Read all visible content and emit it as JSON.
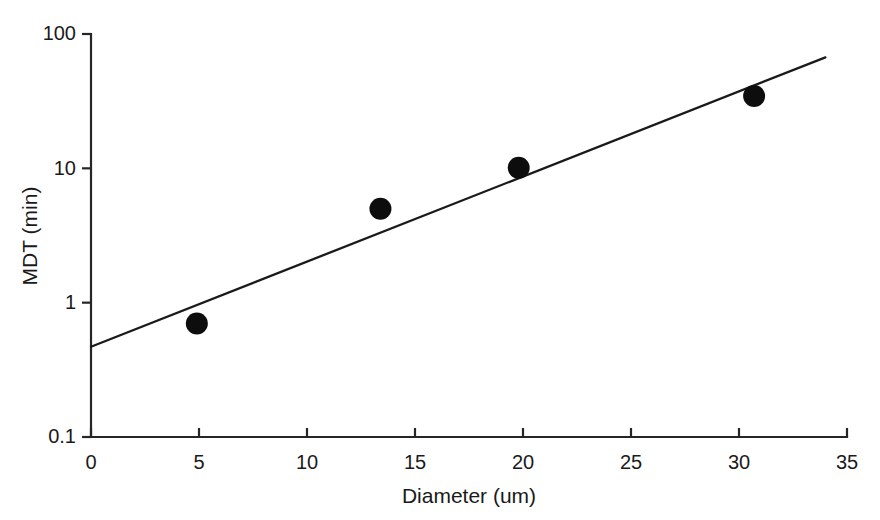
{
  "figure": {
    "background_color": "#ffffff",
    "axis_color": "#262626",
    "marker_color": "#0d0d0d",
    "line_color": "#1a1a1a"
  },
  "chart_data": {
    "type": "scatter",
    "title": "",
    "subtitle": "",
    "xlabel": "Diameter (um)",
    "ylabel": "MDT (min)",
    "xlim": [
      0,
      35
    ],
    "ylim": [
      0.1,
      100
    ],
    "xscale": "linear",
    "yscale": "log",
    "grid": false,
    "legend": false,
    "legend_position": "none",
    "frame": "left-bottom",
    "xticks": [
      0,
      5,
      10,
      15,
      20,
      25,
      30,
      35
    ],
    "xtick_labels": [
      "0",
      "5",
      "10",
      "15",
      "20",
      "25",
      "30",
      "35"
    ],
    "yticks": [
      0.1,
      1,
      10,
      100
    ],
    "ytick_labels": [
      "0.1",
      "1",
      "10",
      "100"
    ],
    "series": [
      {
        "name": "MDT measurements",
        "marker": "filled-circle",
        "marker_size": 22,
        "x": [
          4.9,
          13.4,
          19.8,
          30.7
        ],
        "y": [
          0.7,
          5.0,
          10.1,
          34.5
        ]
      }
    ],
    "fit_line": {
      "name": "exponential fit",
      "style": "solid",
      "x": [
        0,
        34
      ],
      "y": [
        0.47,
        67.0
      ]
    },
    "annotations": []
  }
}
